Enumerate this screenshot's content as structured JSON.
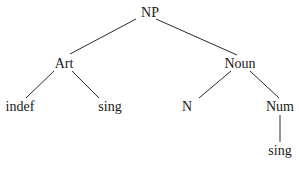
{
  "diagram": {
    "type": "syntax-tree",
    "nodes": [
      {
        "id": "np",
        "label": "NP",
        "x": 150,
        "y": 6
      },
      {
        "id": "art",
        "label": "Art",
        "x": 64,
        "y": 57
      },
      {
        "id": "noun",
        "label": "Noun",
        "x": 240,
        "y": 57
      },
      {
        "id": "indef",
        "label": "indef",
        "x": 20,
        "y": 100
      },
      {
        "id": "sing1",
        "label": "sing",
        "x": 110,
        "y": 100
      },
      {
        "id": "n",
        "label": "N",
        "x": 187,
        "y": 100
      },
      {
        "id": "num",
        "label": "Num",
        "x": 280,
        "y": 100
      },
      {
        "id": "sing2",
        "label": "sing",
        "x": 280,
        "y": 144
      }
    ],
    "edges": [
      {
        "from": "np",
        "to": "art",
        "x1": 136,
        "y1": 19,
        "x2": 70,
        "y2": 54
      },
      {
        "from": "np",
        "to": "noun",
        "x1": 156,
        "y1": 19,
        "x2": 237,
        "y2": 55
      },
      {
        "from": "art",
        "to": "indef",
        "x1": 54,
        "y1": 71,
        "x2": 26,
        "y2": 98
      },
      {
        "from": "art",
        "to": "sing1",
        "x1": 72,
        "y1": 71,
        "x2": 99,
        "y2": 98
      },
      {
        "from": "noun",
        "to": "n",
        "x1": 231,
        "y1": 71,
        "x2": 199,
        "y2": 98
      },
      {
        "from": "noun",
        "to": "num",
        "x1": 250,
        "y1": 71,
        "x2": 279,
        "y2": 98
      },
      {
        "from": "num",
        "to": "sing2",
        "x1": 280,
        "y1": 115,
        "x2": 280,
        "y2": 142
      }
    ],
    "colors": {
      "line": "#2a2a2a",
      "text": "#1a1a1a",
      "background": "#ffffff"
    }
  }
}
